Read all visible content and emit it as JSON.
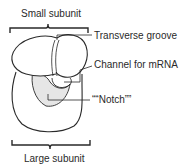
{
  "diagram": {
    "labels": {
      "small_subunit": "Small subunit",
      "large_subunit": "Large subunit",
      "transverse_groove": "Transverse groove",
      "channel_mrna": "Channel for mRNA",
      "notch": "““Notch””"
    },
    "colors": {
      "stroke": "#2a2a2a",
      "notch_fill": "#e6e6e6",
      "background": "#ffffff"
    }
  }
}
